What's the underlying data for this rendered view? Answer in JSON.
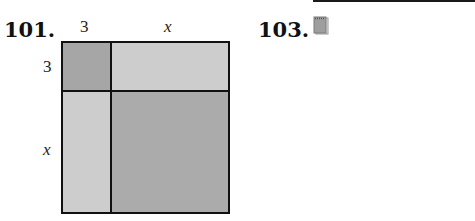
{
  "problems": [
    {
      "number": "101."
    },
    {
      "number": "103."
    }
  ],
  "figure": {
    "top_labels": [
      "3",
      "x"
    ],
    "left_labels": [
      "3",
      "x"
    ],
    "colors": {
      "dark": "#a6a6a6",
      "light": "#cdcdcd",
      "large": "#ababab",
      "border": "#111111"
    }
  },
  "icons": {
    "notepad": "notepad-icon"
  }
}
